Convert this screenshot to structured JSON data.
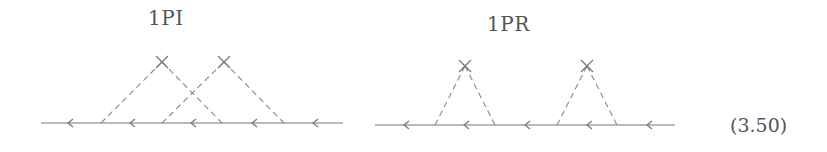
{
  "diagrams": [
    {
      "title": "1PI",
      "title_pos": [
        148,
        6
      ],
      "fermion_line": {
        "x1": 41,
        "x2": 343,
        "y": 123
      },
      "arrow_x": [
        68,
        130,
        191,
        252,
        313
      ],
      "vertices": [
        {
          "cross": [
            162,
            62
          ],
          "left": 101,
          "right": 222
        },
        {
          "cross": [
            224,
            62
          ],
          "left": 162,
          "right": 284
        }
      ]
    },
    {
      "title": "1PR",
      "title_pos": [
        487,
        12
      ],
      "fermion_line": {
        "x1": 375,
        "x2": 675,
        "y": 125
      },
      "arrow_x": [
        404,
        464,
        525,
        587,
        647
      ],
      "vertices": [
        {
          "cross": [
            465,
            66
          ],
          "left": 435,
          "right": 495
        },
        {
          "cross": [
            587,
            66
          ],
          "left": 557,
          "right": 617
        }
      ]
    }
  ],
  "equation_number": "(3.50)",
  "colors": {
    "line": "#777777",
    "dash": "#888888"
  }
}
